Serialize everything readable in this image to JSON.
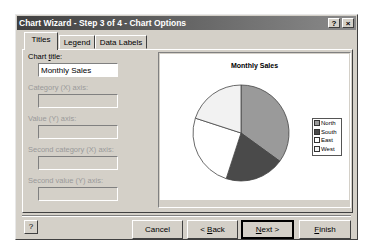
{
  "window": {
    "title": "Chart Wizard - Step 3 of 4 - Chart Options",
    "help_glyph": "?",
    "close_glyph": "×"
  },
  "tabs": [
    {
      "label": "Titles",
      "active": true
    },
    {
      "label": "Legend",
      "active": false
    },
    {
      "label": "Data Labels",
      "active": false
    }
  ],
  "fields": {
    "chart_title": {
      "label": "Chart title:",
      "value": "Monthly Sales",
      "enabled": true
    },
    "category_x": {
      "label": "Category (X) axis:",
      "value": "",
      "enabled": false
    },
    "value_y": {
      "label": "Value (Y) axis:",
      "value": "",
      "enabled": false
    },
    "second_category_x": {
      "label": "Second category (X) axis:",
      "value": "",
      "enabled": false
    },
    "second_value_y": {
      "label": "Second value (Y) axis:",
      "value": "",
      "enabled": false
    }
  },
  "buttons": {
    "help": "?",
    "cancel": "Cancel",
    "back": "< Back",
    "next": "Next >",
    "finish": "Finish"
  },
  "chart_data": {
    "type": "pie",
    "title": "Monthly Sales",
    "categories": [
      "North",
      "South",
      "East",
      "West"
    ],
    "values": [
      35,
      20,
      25,
      20
    ],
    "colors": [
      "#9a9a9a",
      "#4a4a4a",
      "#ffffff",
      "#f2f2f2"
    ],
    "legend_position": "right"
  }
}
